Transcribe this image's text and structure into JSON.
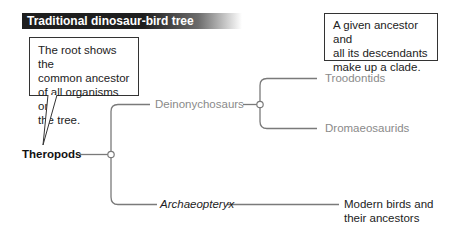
{
  "title": "Traditional dinosaur-bird tree",
  "notes": {
    "root_note": [
      "The root shows the",
      "common ancestor",
      "of all organisms on",
      "the tree."
    ],
    "clade_note": [
      "A given ancestor and",
      "all its descendants",
      "make up a clade."
    ]
  },
  "tree": {
    "root": "Theropods",
    "branch_upper": "Deinonychosaurs",
    "leaf_upper_1": "Troodontids",
    "leaf_upper_2": "Dromaeosaurids",
    "branch_lower": "Archaeopteryx",
    "leaf_lower": [
      "Modern birds and",
      "their ancestors"
    ]
  },
  "colors": {
    "line": "#7a7a7a",
    "gray_label": "#8a8a8a",
    "title_bg": "#1e1e1e"
  }
}
